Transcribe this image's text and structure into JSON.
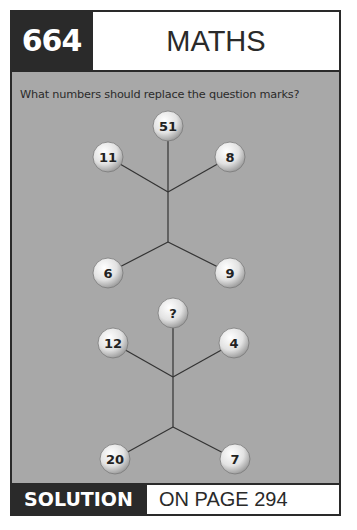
{
  "header": {
    "puzzle_number": "664",
    "title": "MATHS MYSTERY"
  },
  "question": "What numbers should replace the question marks?",
  "colors": {
    "dark": "#2a2a2a",
    "panel": "#a8a8a8",
    "ball_light": "#ffffff",
    "ball_dark": "#9a9a9a",
    "line": "#333333"
  },
  "trees": [
    {
      "top": "51",
      "upper_left": "11",
      "upper_right": "8",
      "lower_left": "6",
      "lower_right": "9"
    },
    {
      "top": "?",
      "upper_left": "12",
      "upper_right": "4",
      "lower_left": "20",
      "lower_right": "7"
    }
  ],
  "footer": {
    "solution_label": "SOLUTION",
    "page_ref": "ON PAGE 294"
  }
}
